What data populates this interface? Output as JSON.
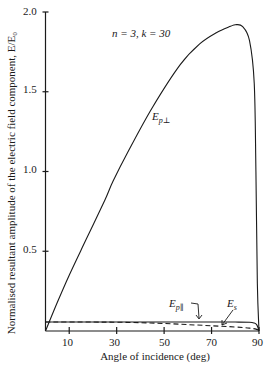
{
  "chart_data": {
    "type": "line",
    "title": "",
    "annotation": "n = 3, k = 30",
    "xlabel": "Angle of incidence (deg)",
    "ylabel": "Normalised resultant amplitude of the electric field component, E/E₀",
    "xlim": [
      0,
      90
    ],
    "ylim": [
      0,
      2.0
    ],
    "xticks": [
      10,
      30,
      50,
      70,
      90
    ],
    "yticks": [
      0.5,
      1.0,
      1.5,
      2.0
    ],
    "grid": false,
    "legend": "inline labels",
    "series": [
      {
        "name": "E_p⊥",
        "style": "solid",
        "x": [
          0,
          5,
          10,
          17,
          25,
          28.5,
          35,
          45,
          56.8,
          65,
          72,
          78,
          80,
          83,
          86,
          88,
          88.7,
          89.3,
          90
        ],
        "y": [
          0,
          0.18,
          0.35,
          0.57,
          0.82,
          0.94,
          1.13,
          1.4,
          1.67,
          1.8,
          1.87,
          1.91,
          1.92,
          1.91,
          1.82,
          1.55,
          1.0,
          0.3,
          0
        ]
      },
      {
        "name": "E_p∥",
        "style": "solid",
        "x": [
          0,
          20,
          40,
          60,
          80,
          86,
          88,
          89,
          89.6,
          90
        ],
        "y": [
          0.056,
          0.056,
          0.056,
          0.056,
          0.056,
          0.055,
          0.05,
          0.04,
          0.02,
          0
        ]
      },
      {
        "name": "E_s",
        "style": "dashed",
        "x": [
          0,
          20,
          30,
          40,
          50,
          60,
          70,
          80,
          86,
          89,
          90
        ],
        "y": [
          0.056,
          0.056,
          0.055,
          0.052,
          0.047,
          0.04,
          0.033,
          0.025,
          0.018,
          0.01,
          0
        ]
      }
    ]
  },
  "labels": {
    "annotation": "n = 3, k = 30",
    "xlabel": "Angle of incidence (deg)",
    "ylabel": "Normalised resultant amplitude of the electric field component, E/E₀",
    "yticks": [
      "2.0",
      "1.5",
      "1.0",
      "0.5"
    ],
    "xticks": [
      "10",
      "30",
      "50",
      "70",
      "90"
    ],
    "curve_perp_main": "E",
    "curve_perp_sub": "p⊥",
    "curve_par_main": "E",
    "curve_par_sub": "p∥",
    "curve_s_main": "E",
    "curve_s_sub": "s"
  }
}
